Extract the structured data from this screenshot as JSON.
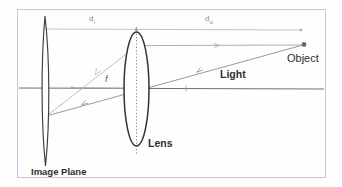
{
  "figure": {
    "type": "optical-ray-diagram",
    "frame": {
      "color": "#c9c9c9"
    },
    "labels": {
      "image_distance": "d",
      "image_distance_sub": "i",
      "object_distance": "d",
      "object_distance_sub": "o",
      "focal_length": "f",
      "object": "Object",
      "light": "Light",
      "lens": "Lens",
      "image_plane": "Image Plane"
    },
    "elements": {
      "optical_axis": "optical-axis",
      "lens_body": "lens-ellipse",
      "lens_center_line": "lens-center-dotted-line",
      "image_plane_body": "image-plane-ellipse",
      "object_point": "object-point-marker",
      "dimension_line": "dimension-line",
      "ray_parallel": "parallel-ray",
      "ray_chief": "chief-ray",
      "ray_focal": "focal-ray"
    },
    "colors": {
      "ink": "#2e2e2e",
      "ray": "#9a9a9a",
      "axis": "#7d7d7d",
      "dimension": "#b5b5b5",
      "lens_outline": "#3d3d3d"
    }
  }
}
